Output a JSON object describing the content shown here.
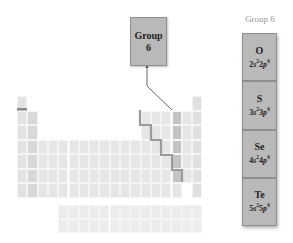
{
  "callout": {
    "line1": "Group",
    "line2": "6"
  },
  "panel": {
    "title": "Group 6",
    "elements": [
      {
        "symbol": "O",
        "n": "2",
        "config": {
          "s_n": "2",
          "s_e": "2",
          "p_n": "2",
          "p_e": "4"
        }
      },
      {
        "symbol": "S",
        "n": "3",
        "config": {
          "s_n": "3",
          "s_e": "2",
          "p_n": "3",
          "p_e": "4"
        }
      },
      {
        "symbol": "Se",
        "n": "4",
        "config": {
          "s_n": "4",
          "s_e": "2",
          "p_n": "4",
          "p_e": "4"
        }
      },
      {
        "symbol": "Te",
        "n": "5",
        "config": {
          "s_n": "5",
          "s_e": "2",
          "p_n": "5",
          "p_e": "4"
        }
      }
    ]
  },
  "colors": {
    "highlight_group": "#c4c4c4",
    "callout_fill": "#b9b9b9",
    "staircase": "#9a9a9a",
    "hydrogen_bar": "#8a8a8a"
  },
  "table": {
    "highlighted_group": 16,
    "columns": 18,
    "main_rows": 7,
    "f_block_rows": 2
  }
}
